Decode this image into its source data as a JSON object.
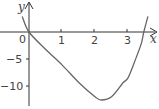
{
  "chart_data": {
    "type": "line",
    "title": "",
    "xlabel": "x",
    "ylabel": "y",
    "origin_label": "0",
    "x_ticks": [
      1,
      2,
      3
    ],
    "x_tick_labels": [
      "1",
      "2",
      "3"
    ],
    "y_ticks": [
      -5,
      -10
    ],
    "y_tick_labels": [
      "−5",
      "−10"
    ],
    "xlim": [
      -0.85,
      3.9
    ],
    "ylim": [
      -13.8,
      5.9
    ],
    "grid": false,
    "legend": null,
    "series": [
      {
        "name": "curve",
        "color": "#666666",
        "x": [
          -0.2,
          0,
          0.5,
          1,
          1.5,
          2,
          2.2,
          2.5,
          2.85,
          3,
          3.2,
          3.4,
          3.48,
          3.6
        ],
        "y": [
          2.8,
          0,
          -3.2,
          -6.1,
          -9.3,
          -12.0,
          -12.6,
          -12.0,
          -9.4,
          -8.5,
          -5.5,
          -2.2,
          0,
          2.8
        ]
      }
    ]
  },
  "colors": {
    "axis": "#333333",
    "curve": "#666666",
    "text": "#444444"
  }
}
